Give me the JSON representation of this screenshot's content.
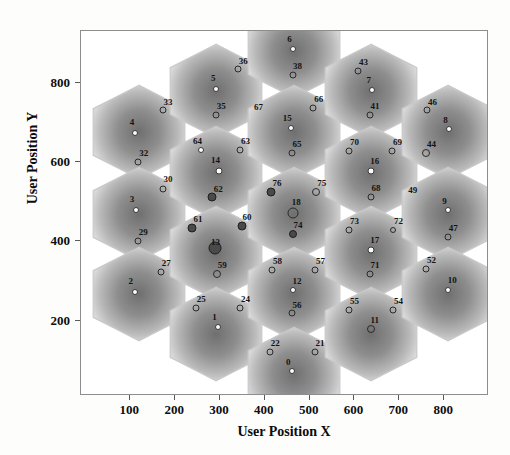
{
  "chart_data": {
    "type": "scatter",
    "title": "",
    "xlabel": "User Position X",
    "ylabel": "User Position Y",
    "xlim": [
      -10,
      900
    ],
    "ylim": [
      10,
      930
    ],
    "xticks": [
      100,
      200,
      300,
      400,
      500,
      600,
      700,
      800
    ],
    "yticks": [
      200,
      400,
      600,
      800
    ],
    "grid": false,
    "legend": null,
    "colors": {
      "frame": "#8d8d8d",
      "hex_edge": "#c9c9c9",
      "marker_open": "#2a2a2a",
      "marker_fill_light": "#fbfbfb",
      "marker_fill_dark": "#4a4a4a",
      "text": "#141414",
      "background": "#ffffff"
    },
    "hex_cells": [
      {
        "cx": 120,
        "cy": 675,
        "r": 118
      },
      {
        "cx": 120,
        "cy": 470,
        "r": 118
      },
      {
        "cx": 120,
        "cy": 268,
        "r": 118
      },
      {
        "cx": 292,
        "cy": 778,
        "r": 118
      },
      {
        "cx": 292,
        "cy": 573,
        "r": 118
      },
      {
        "cx": 292,
        "cy": 370,
        "r": 118
      },
      {
        "cx": 292,
        "cy": 167,
        "r": 118
      },
      {
        "cx": 464,
        "cy": 880,
        "r": 118
      },
      {
        "cx": 464,
        "cy": 675,
        "r": 118
      },
      {
        "cx": 464,
        "cy": 470,
        "r": 118
      },
      {
        "cx": 464,
        "cy": 268,
        "r": 118
      },
      {
        "cx": 464,
        "cy": 65,
        "r": 118
      },
      {
        "cx": 636,
        "cy": 778,
        "r": 118
      },
      {
        "cx": 636,
        "cy": 573,
        "r": 118
      },
      {
        "cx": 636,
        "cy": 370,
        "r": 118
      },
      {
        "cx": 636,
        "cy": 167,
        "r": 118
      },
      {
        "cx": 808,
        "cy": 675,
        "r": 118
      },
      {
        "cx": 808,
        "cy": 470,
        "r": 118
      },
      {
        "cx": 808,
        "cy": 268,
        "r": 118
      }
    ],
    "points": [
      {
        "label": "4",
        "x": 110,
        "y": 672,
        "style": "white",
        "size": 6,
        "lx": 104,
        "ly": 700
      },
      {
        "label": "33",
        "x": 172,
        "y": 730,
        "style": "open",
        "size": 7,
        "lx": 184,
        "ly": 752
      },
      {
        "label": "32",
        "x": 118,
        "y": 600,
        "style": "open",
        "size": 7,
        "lx": 130,
        "ly": 622
      },
      {
        "label": "3",
        "x": 112,
        "y": 478,
        "style": "white",
        "size": 6,
        "lx": 104,
        "ly": 506
      },
      {
        "label": "30",
        "x": 172,
        "y": 533,
        "style": "open",
        "size": 7,
        "lx": 184,
        "ly": 556
      },
      {
        "label": "29",
        "x": 117,
        "y": 400,
        "style": "open",
        "size": 7,
        "lx": 129,
        "ly": 423
      },
      {
        "label": "2",
        "x": 110,
        "y": 272,
        "style": "white",
        "size": 6,
        "lx": 101,
        "ly": 300
      },
      {
        "label": "27",
        "x": 168,
        "y": 322,
        "style": "open",
        "size": 7,
        "lx": 180,
        "ly": 345
      },
      {
        "label": "5",
        "x": 292,
        "y": 784,
        "style": "white",
        "size": 6,
        "lx": 285,
        "ly": 812
      },
      {
        "label": "36",
        "x": 340,
        "y": 833,
        "style": "open",
        "size": 7,
        "lx": 352,
        "ly": 855
      },
      {
        "label": "35",
        "x": 291,
        "y": 718,
        "style": "open",
        "size": 7,
        "lx": 303,
        "ly": 740
      },
      {
        "label": "64",
        "x": 258,
        "y": 630,
        "style": "white",
        "size": 6,
        "lx": 250,
        "ly": 652
      },
      {
        "label": "14",
        "x": 297,
        "y": 578,
        "style": "white",
        "size": 7,
        "lx": 290,
        "ly": 604
      },
      {
        "label": "63",
        "x": 345,
        "y": 631,
        "style": "open",
        "size": 7,
        "lx": 357,
        "ly": 653
      },
      {
        "label": "62",
        "x": 283,
        "y": 512,
        "style": "dark",
        "size": 9,
        "lx": 296,
        "ly": 533
      },
      {
        "label": "61",
        "x": 238,
        "y": 434,
        "style": "dark",
        "size": 9,
        "lx": 251,
        "ly": 456
      },
      {
        "label": "13",
        "x": 288,
        "y": 382,
        "style": "dark",
        "size": 13,
        "lx": 290,
        "ly": 398
      },
      {
        "label": "60",
        "x": 348,
        "y": 438,
        "style": "dark",
        "size": 9,
        "lx": 360,
        "ly": 460
      },
      {
        "label": "59",
        "x": 293,
        "y": 318,
        "style": "open",
        "size": 8,
        "lx": 305,
        "ly": 340
      },
      {
        "label": "25",
        "x": 247,
        "y": 232,
        "style": "open",
        "size": 7,
        "lx": 258,
        "ly": 254
      },
      {
        "label": "1",
        "x": 295,
        "y": 185,
        "style": "white",
        "size": 6,
        "lx": 288,
        "ly": 210
      },
      {
        "label": "24",
        "x": 345,
        "y": 232,
        "style": "open",
        "size": 7,
        "lx": 357,
        "ly": 254
      },
      {
        "label": "6",
        "x": 462,
        "y": 884,
        "style": "white",
        "size": 6,
        "lx": 455,
        "ly": 910
      },
      {
        "label": "38",
        "x": 462,
        "y": 820,
        "style": "open",
        "size": 7,
        "lx": 473,
        "ly": 842
      },
      {
        "label": "67",
        "x": 386,
        "y": 738,
        "style": "none",
        "size": 0,
        "lx": 386,
        "ly": 738
      },
      {
        "label": "15",
        "x": 458,
        "y": 685,
        "style": "white",
        "size": 6,
        "lx": 450,
        "ly": 710
      },
      {
        "label": "66",
        "x": 508,
        "y": 737,
        "style": "open",
        "size": 7,
        "lx": 520,
        "ly": 758
      },
      {
        "label": "65",
        "x": 460,
        "y": 622,
        "style": "open",
        "size": 7,
        "lx": 472,
        "ly": 644
      },
      {
        "label": "76",
        "x": 414,
        "y": 524,
        "style": "dark",
        "size": 9,
        "lx": 427,
        "ly": 546
      },
      {
        "label": "18",
        "x": 463,
        "y": 472,
        "style": "open",
        "size": 11,
        "lx": 470,
        "ly": 498
      },
      {
        "label": "75",
        "x": 515,
        "y": 524,
        "style": "open",
        "size": 8,
        "lx": 527,
        "ly": 547
      },
      {
        "label": "74",
        "x": 462,
        "y": 418,
        "style": "dark",
        "size": 8,
        "lx": 474,
        "ly": 440
      },
      {
        "label": "58",
        "x": 416,
        "y": 328,
        "style": "open",
        "size": 7,
        "lx": 428,
        "ly": 350
      },
      {
        "label": "12",
        "x": 462,
        "y": 276,
        "style": "white",
        "size": 6,
        "lx": 472,
        "ly": 300
      },
      {
        "label": "57",
        "x": 512,
        "y": 328,
        "style": "open",
        "size": 7,
        "lx": 524,
        "ly": 350
      },
      {
        "label": "56",
        "x": 460,
        "y": 218,
        "style": "open",
        "size": 7,
        "lx": 472,
        "ly": 240
      },
      {
        "label": "22",
        "x": 412,
        "y": 122,
        "style": "open",
        "size": 7,
        "lx": 423,
        "ly": 144
      },
      {
        "label": "0",
        "x": 460,
        "y": 72,
        "style": "white",
        "size": 6,
        "lx": 452,
        "ly": 96
      },
      {
        "label": "21",
        "x": 512,
        "y": 122,
        "style": "open",
        "size": 7,
        "lx": 523,
        "ly": 144
      },
      {
        "label": "43",
        "x": 608,
        "y": 830,
        "style": "open",
        "size": 7,
        "lx": 620,
        "ly": 852
      },
      {
        "label": "7",
        "x": 638,
        "y": 782,
        "style": "white",
        "size": 6,
        "lx": 632,
        "ly": 806
      },
      {
        "label": "41",
        "x": 634,
        "y": 718,
        "style": "open",
        "size": 7,
        "lx": 646,
        "ly": 740
      },
      {
        "label": "70",
        "x": 588,
        "y": 628,
        "style": "open",
        "size": 7,
        "lx": 600,
        "ly": 650
      },
      {
        "label": "16",
        "x": 636,
        "y": 578,
        "style": "white",
        "size": 7,
        "lx": 645,
        "ly": 602
      },
      {
        "label": "69",
        "x": 684,
        "y": 628,
        "style": "open",
        "size": 7,
        "lx": 696,
        "ly": 650
      },
      {
        "label": "68",
        "x": 636,
        "y": 512,
        "style": "open",
        "size": 7,
        "lx": 648,
        "ly": 534
      },
      {
        "label": "73",
        "x": 588,
        "y": 428,
        "style": "open",
        "size": 7,
        "lx": 600,
        "ly": 450
      },
      {
        "label": "17",
        "x": 636,
        "y": 378,
        "style": "white",
        "size": 7,
        "lx": 645,
        "ly": 402
      },
      {
        "label": "72",
        "x": 686,
        "y": 428,
        "style": "open",
        "size": 6,
        "lx": 698,
        "ly": 450
      },
      {
        "label": "71",
        "x": 634,
        "y": 318,
        "style": "open",
        "size": 7,
        "lx": 646,
        "ly": 340
      },
      {
        "label": "55",
        "x": 588,
        "y": 228,
        "style": "open",
        "size": 7,
        "lx": 600,
        "ly": 250
      },
      {
        "label": "11",
        "x": 636,
        "y": 178,
        "style": "open",
        "size": 8,
        "lx": 645,
        "ly": 202
      },
      {
        "label": "54",
        "x": 686,
        "y": 228,
        "style": "open",
        "size": 7,
        "lx": 698,
        "ly": 250
      },
      {
        "label": "46",
        "x": 762,
        "y": 730,
        "style": "open",
        "size": 7,
        "lx": 774,
        "ly": 752
      },
      {
        "label": "8",
        "x": 810,
        "y": 682,
        "style": "white",
        "size": 6,
        "lx": 803,
        "ly": 706
      },
      {
        "label": "44",
        "x": 760,
        "y": 622,
        "style": "open",
        "size": 8,
        "lx": 772,
        "ly": 645
      },
      {
        "label": "49",
        "x": 730,
        "y": 530,
        "style": "none",
        "size": 0,
        "lx": 730,
        "ly": 530
      },
      {
        "label": "9",
        "x": 808,
        "y": 478,
        "style": "white",
        "size": 6,
        "lx": 801,
        "ly": 502
      },
      {
        "label": "47",
        "x": 808,
        "y": 412,
        "style": "open",
        "size": 7,
        "lx": 820,
        "ly": 434
      },
      {
        "label": "52",
        "x": 760,
        "y": 330,
        "style": "open",
        "size": 7,
        "lx": 772,
        "ly": 352
      },
      {
        "label": "10",
        "x": 808,
        "y": 278,
        "style": "white",
        "size": 6,
        "lx": 818,
        "ly": 302
      }
    ]
  }
}
